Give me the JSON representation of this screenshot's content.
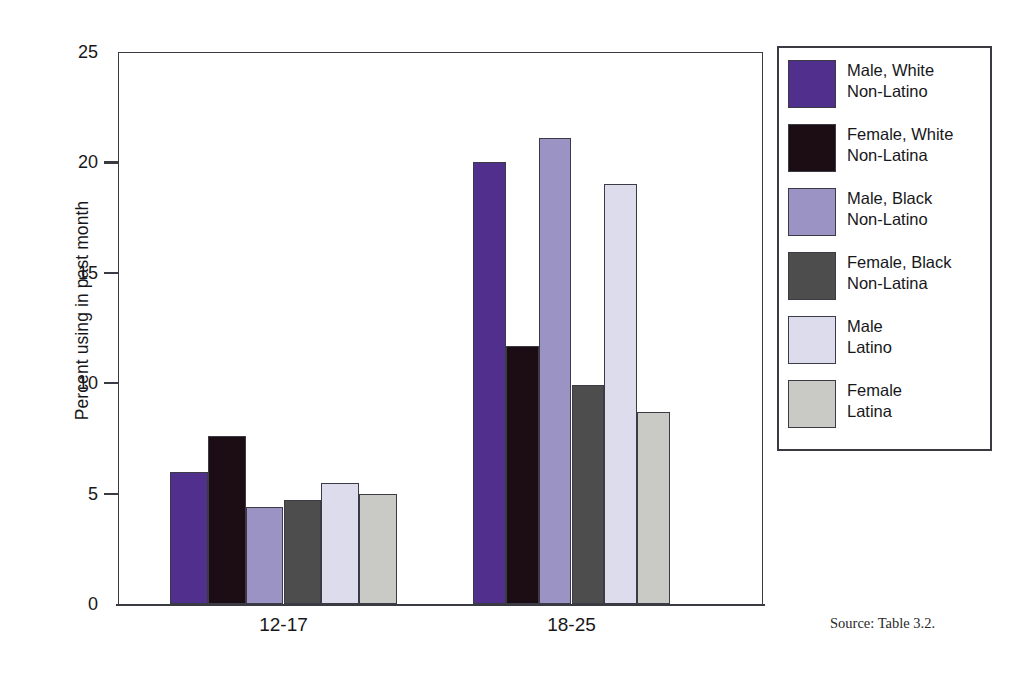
{
  "chart_data": {
    "type": "bar",
    "title": "",
    "subtitle": "",
    "xlabel": "",
    "ylabel": "Percent using in past month",
    "ylim": [
      0,
      25
    ],
    "yticks": [
      0,
      5,
      10,
      15,
      20,
      25
    ],
    "grid": false,
    "legend_position": "right",
    "categories": [
      "12-17",
      "18-25"
    ],
    "series": [
      {
        "name": "Male, White\nNon-Latino",
        "color": "#512f8c",
        "values": [
          6.0,
          20.0
        ]
      },
      {
        "name": "Female, White\nNon-Latina",
        "color": "#1c0d14",
        "values": [
          7.6,
          11.7
        ]
      },
      {
        "name": "Male, Black\nNon-Latino",
        "color": "#9b93c4",
        "values": [
          4.4,
          21.1
        ]
      },
      {
        "name": "Female, Black\nNon-Latina",
        "color": "#4d4d4d",
        "values": [
          4.7,
          9.9
        ]
      },
      {
        "name": "Male\nLatino",
        "color": "#dcdced",
        "values": [
          5.5,
          19.0
        ]
      },
      {
        "name": "Female\nLatina",
        "color": "#c9cac6",
        "values": [
          5.0,
          8.7
        ]
      }
    ],
    "source_note": "Source: Table 3.2."
  },
  "axis": {
    "y_title": "Percent using in past month",
    "y_tick_labels": [
      "25",
      "20",
      "15",
      "10",
      "5",
      "0"
    ],
    "x_tick_labels": [
      "12-17",
      "18-25"
    ]
  },
  "legend": {
    "entries": [
      {
        "label": "Male, White\nNon-Latino",
        "color": "#512f8c"
      },
      {
        "label": "Female, White\nNon-Latina",
        "color": "#1c0d14"
      },
      {
        "label": "Male, Black\nNon-Latino",
        "color": "#9b93c4"
      },
      {
        "label": "Female, Black\nNon-Latina",
        "color": "#4d4d4d"
      },
      {
        "label": "Male\nLatino",
        "color": "#dcdced"
      },
      {
        "label": "Female\nLatina",
        "color": "#c9cac6"
      }
    ]
  },
  "footer": {
    "source": "Source: Table 3.2."
  }
}
